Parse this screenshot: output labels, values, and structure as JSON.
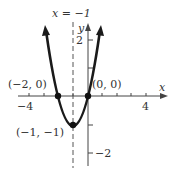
{
  "figure": {
    "equation_label": "x = −1",
    "axis_x_label": "x",
    "axis_y_label": "y",
    "x_ticks": [
      {
        "value": -4,
        "label": "−4"
      },
      {
        "value": 4,
        "label": "4"
      }
    ],
    "y_ticks": [
      {
        "value": 2,
        "label": "2"
      },
      {
        "value": -2,
        "label": "−2"
      }
    ],
    "points": [
      {
        "name": "left-root",
        "label": "(−2, 0)",
        "x": -2,
        "y": 0
      },
      {
        "name": "origin-root",
        "label": "(0, 0)",
        "x": 0,
        "y": 0
      },
      {
        "name": "vertex",
        "label": "(−1, −1)",
        "x": -1,
        "y": -1
      }
    ],
    "curve": "y = x^2 + 2x",
    "axis_of_symmetry": -1,
    "colors": {
      "curve": "#1a1a1a",
      "axis": "#333333",
      "text": "#333333"
    }
  }
}
